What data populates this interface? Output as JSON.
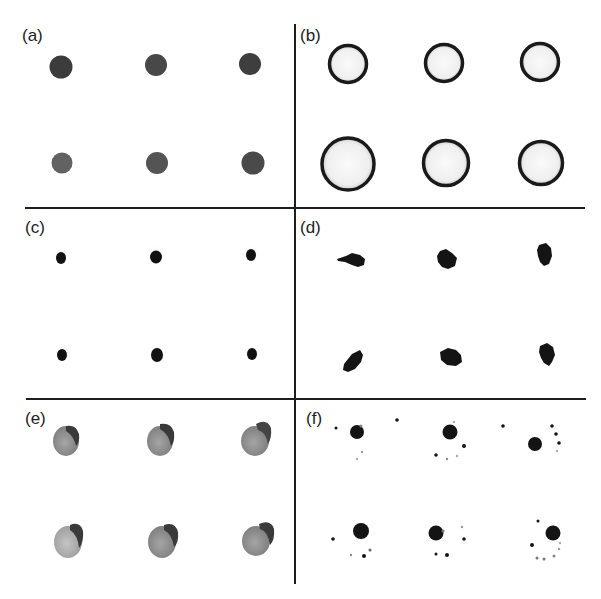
{
  "figure": {
    "panels": [
      {
        "id": "a",
        "label": "(a)",
        "description": "solid grey-dark dots, 2 rows x 3 columns"
      },
      {
        "id": "b",
        "label": "(b)",
        "description": "hollow rings with dark edge, 2 rows x 3 columns"
      },
      {
        "id": "c",
        "label": "(c)",
        "description": "small black dots with faint halo, 2 rows x 3 columns"
      },
      {
        "id": "d",
        "label": "(d)",
        "description": "irregular black blobs, 2 rows x 3 columns"
      },
      {
        "id": "e",
        "label": "(e)",
        "description": "grey textured droplets with dark cap, 2 rows x 3 columns"
      },
      {
        "id": "f",
        "label": "(f)",
        "description": "dark cores with scattered satellite specks, 2 rows x 3 columns"
      }
    ],
    "colors": {
      "grid_line": "#1e1e1e",
      "label": "#222222",
      "panel_a_top": "#3e3e3e",
      "panel_a_bottom": "#5a5a5a",
      "ring": "#1a1a1a",
      "ring_fill": "#f2f2f2",
      "black_spot": "#111111",
      "droplet_fill": "#8a8a8a",
      "droplet_cap": "#3a3a3a"
    }
  }
}
